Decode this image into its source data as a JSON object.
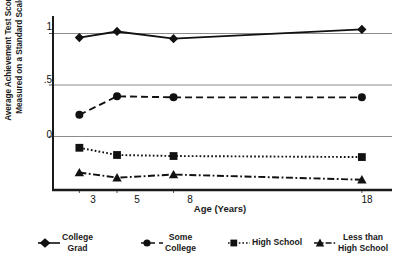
{
  "chart_data": {
    "type": "line",
    "title": "",
    "xlabel": "Age (Years)",
    "ylabel": "Average Achievement Test Scores Measured on a Standard Scale",
    "ylabel_lines": [
      "Average Achievement Test Scores",
      "Measured on a Standard Scale"
    ],
    "categories": [
      "3",
      "5",
      "8",
      "18"
    ],
    "x": [
      3,
      5,
      8,
      18
    ],
    "xticks": [
      "3",
      "5",
      "8",
      "18"
    ],
    "yticks": [
      "1",
      ".5",
      "0"
    ],
    "ytick_values": [
      1,
      0.5,
      0
    ],
    "ylim": [
      -0.52,
      1.17
    ],
    "xlim": [
      1.6,
      19.6
    ],
    "grid": "horizontal",
    "legend_position": "bottom",
    "series": [
      {
        "name": "College Grad",
        "label_lines": [
          "College",
          "Grad"
        ],
        "marker": "diamond",
        "line_style": "solid",
        "color": "#111111",
        "values": [
          0.96,
          1.02,
          0.95,
          1.04
        ]
      },
      {
        "name": "Some College",
        "label_lines": [
          "Some",
          "College"
        ],
        "marker": "circle",
        "line_style": "dashed",
        "color": "#111111",
        "values": [
          0.21,
          0.39,
          0.38,
          0.38
        ]
      },
      {
        "name": "High School",
        "label_lines": [
          "High School"
        ],
        "marker": "square",
        "line_style": "dotted",
        "color": "#111111",
        "values": [
          -0.11,
          -0.18,
          -0.19,
          -0.2
        ]
      },
      {
        "name": "Less than High School",
        "label_lines": [
          "Less than",
          "High School"
        ],
        "marker": "triangle",
        "line_style": "dashdot",
        "color": "#111111",
        "values": [
          -0.35,
          -0.4,
          -0.37,
          -0.42
        ]
      }
    ]
  },
  "axes": {
    "frame_color": "#1a1a1a",
    "grid_color": "#8c8c8c"
  }
}
